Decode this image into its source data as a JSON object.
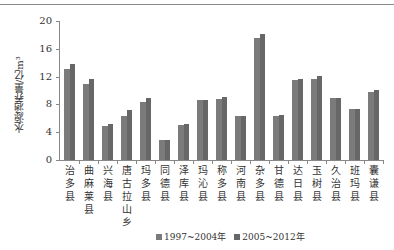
{
  "chart_data": {
    "type": "bar",
    "title": "",
    "xlabel": "",
    "ylabel": "水源涵养量/亿m³",
    "ylim": [
      0,
      20
    ],
    "yticks": [
      0,
      4,
      8,
      12,
      16,
      20
    ],
    "grid": false,
    "legend_position": "bottom",
    "categories": [
      "治多县",
      "曲麻莱县",
      "兴海县",
      "唐古拉山乡",
      "玛多县",
      "同德县",
      "泽库县",
      "玛沁县",
      "称多县",
      "河南县",
      "杂多县",
      "甘德县",
      "达日县",
      "玉树县",
      "久治县",
      "班玛县",
      "囊谦县"
    ],
    "series": [
      {
        "name": "1997~2004年",
        "color": "#7b7b7b",
        "values": [
          13.1,
          10.9,
          4.9,
          6.4,
          8.3,
          2.9,
          5.0,
          8.7,
          8.8,
          6.4,
          17.6,
          6.4,
          11.5,
          11.7,
          8.9,
          7.3,
          9.8
        ]
      },
      {
        "name": "2005~2012年",
        "color": "#676767",
        "values": [
          13.8,
          11.6,
          5.2,
          7.2,
          8.9,
          2.9,
          5.2,
          8.7,
          9.0,
          6.4,
          18.2,
          6.5,
          11.7,
          12.1,
          8.9,
          7.4,
          10.1
        ]
      }
    ]
  },
  "legend": {
    "items": [
      {
        "label": "1997~2004年",
        "color": "#7b7b7b"
      },
      {
        "label": "2005~2012年",
        "color": "#676767"
      }
    ]
  }
}
